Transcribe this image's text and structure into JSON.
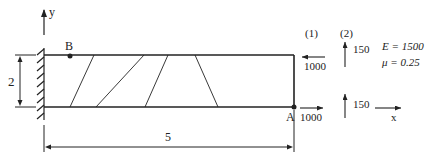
{
  "diagram": {
    "axes": {
      "y_label": "y",
      "x_label": "x"
    },
    "points": {
      "B": "B",
      "A": "A"
    },
    "dimensions": {
      "height": "2",
      "length": "5"
    },
    "load_cases": {
      "case1": {
        "label": "(1)",
        "top_load": "1000",
        "bottom_load": "1000"
      },
      "case2": {
        "label": "(2)",
        "top_load": "150",
        "bottom_load": "150"
      }
    },
    "material": {
      "E": "E = 1500",
      "mu": "μ = 0.25"
    },
    "colors": {
      "line": "#222222",
      "background": "#ffffff"
    }
  }
}
